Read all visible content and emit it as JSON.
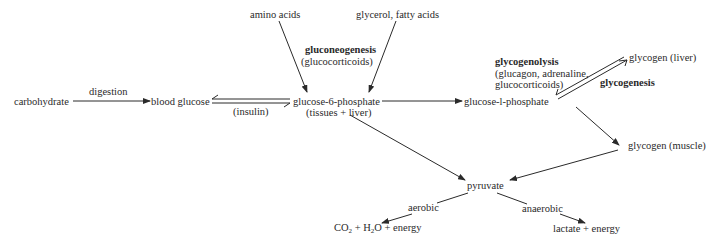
{
  "diagram": {
    "nodes": {
      "carbohydrate": "carbohydrate",
      "blood_glucose": "blood glucose",
      "amino_acids": "amino acids",
      "glycerol_fatty_acids": "glycerol, fatty acids",
      "g6p_line1": "glucose-6-phosphate",
      "g6p_line2": "(tissues + liver)",
      "g1p": "glucose-l-phosphate",
      "glycogen_liver": "glycogen (liver)",
      "glycogen_muscle": "glycogen (muscle)",
      "pyruvate": "pyruvate",
      "aerobic_product_co": "CO",
      "aerobic_product_sub1": "2",
      "aerobic_product_mid": " + H",
      "aerobic_product_sub2": "2",
      "aerobic_product_end": "O + energy",
      "anaerobic_product": "lactate + energy"
    },
    "edge_labels": {
      "digestion": "digestion",
      "insulin": "(insulin)",
      "gluconeogenesis": "gluconeogenesis",
      "glucocorticoids": "(glucocorticoids)",
      "glycogenolysis": "glycogenolysis",
      "glycogenolysis_hormones_1": "(glucagon, adrenaline,",
      "glycogenolysis_hormones_2": "glucocorticoids)",
      "glycogenesis": "glycogenesis",
      "aerobic": "aerobic",
      "anaerobic": "anaerobic"
    },
    "colors": {
      "ink": "#2a2a2a",
      "background": "#ffffff"
    }
  }
}
